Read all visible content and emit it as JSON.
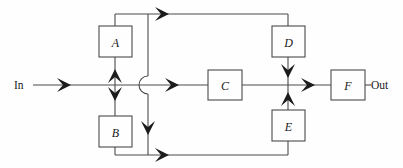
{
  "diagram": {
    "type": "signal-flow-block-diagram",
    "title": "",
    "canvas": {
      "width": 403,
      "height": 168,
      "background": "#fefefe"
    },
    "style": {
      "wire_color": "#4a4a4a",
      "arrow_color": "#1c1c1c",
      "box_fill": "#fefefe",
      "box_stroke": "#4a4a4a",
      "text_color": "#1a1a1a"
    },
    "ports": [
      {
        "id": "in",
        "label": "In",
        "x": 16,
        "y": 85,
        "side": "left"
      },
      {
        "id": "out",
        "label": "Out",
        "x": 372,
        "y": 85,
        "side": "right"
      }
    ],
    "blocks": [
      {
        "id": "A",
        "label": "A",
        "x": 99,
        "y": 26,
        "w": 33,
        "h": 31
      },
      {
        "id": "B",
        "label": "B",
        "x": 99,
        "y": 116,
        "w": 33,
        "h": 31
      },
      {
        "id": "C",
        "label": "C",
        "x": 208,
        "y": 70,
        "w": 34,
        "h": 30
      },
      {
        "id": "D",
        "label": "D",
        "x": 272,
        "y": 26,
        "w": 33,
        "h": 31
      },
      {
        "id": "E",
        "label": "E",
        "x": 272,
        "y": 110,
        "w": 33,
        "h": 31
      },
      {
        "id": "F",
        "label": "F",
        "x": 331,
        "y": 70,
        "w": 34,
        "h": 30
      }
    ],
    "junctions": [
      {
        "id": "split-node",
        "x": 115,
        "y": 85
      },
      {
        "id": "summing-node",
        "x": 288,
        "y": 85
      }
    ],
    "crossover": {
      "id": "wire-hop",
      "x": 148,
      "y": 85,
      "radius": 9,
      "bulge": "left"
    },
    "rails": {
      "top_y": 14,
      "middle_y": 85,
      "bottom_y": 155,
      "left_branch_x": 115,
      "drop_x": 148,
      "right_branch_x": 288
    },
    "arrows": [
      {
        "id": "arrow-in",
        "x": 68,
        "y": 85,
        "dir": "right"
      },
      {
        "id": "arrow-split-up",
        "x": 115,
        "y": 76,
        "dir": "up"
      },
      {
        "id": "arrow-split-down",
        "x": 115,
        "y": 94,
        "dir": "down"
      },
      {
        "id": "arrow-top-rail",
        "x": 166,
        "y": 14,
        "dir": "right"
      },
      {
        "id": "arrow-middle-mid",
        "x": 176,
        "y": 85,
        "dir": "right"
      },
      {
        "id": "arrow-drop-down",
        "x": 148,
        "y": 128,
        "dir": "down"
      },
      {
        "id": "arrow-bottom-rail",
        "x": 166,
        "y": 155,
        "dir": "right"
      },
      {
        "id": "arrow-d-out",
        "x": 288,
        "y": 70,
        "dir": "down"
      },
      {
        "id": "arrow-e-out",
        "x": 288,
        "y": 100,
        "dir": "up"
      },
      {
        "id": "arrow-to-f",
        "x": 312,
        "y": 85,
        "dir": "right"
      }
    ],
    "edges": [
      {
        "id": "edge-in-to-split",
        "from": "in",
        "to": "split-node"
      },
      {
        "id": "edge-split-to-a",
        "from": "split-node",
        "to": "A"
      },
      {
        "id": "edge-split-to-b",
        "from": "split-node",
        "to": "B"
      },
      {
        "id": "edge-a-to-top-rail",
        "from": "A",
        "to": "top-rail"
      },
      {
        "id": "edge-top-rail-to-d",
        "from": "top-rail",
        "to": "D"
      },
      {
        "id": "edge-b-to-bottom-rail",
        "from": "B",
        "to": "bottom-rail"
      },
      {
        "id": "edge-bottom-rail-to-e",
        "from": "bottom-rail",
        "to": "E"
      },
      {
        "id": "edge-split-to-c",
        "from": "split-node",
        "to": "C"
      },
      {
        "id": "edge-c-to-sum",
        "from": "C",
        "to": "summing-node"
      },
      {
        "id": "edge-d-to-sum",
        "from": "D",
        "to": "summing-node"
      },
      {
        "id": "edge-e-to-sum",
        "from": "E",
        "to": "summing-node"
      },
      {
        "id": "edge-sum-to-f",
        "from": "summing-node",
        "to": "F"
      },
      {
        "id": "edge-f-to-out",
        "from": "F",
        "to": "out"
      }
    ]
  }
}
